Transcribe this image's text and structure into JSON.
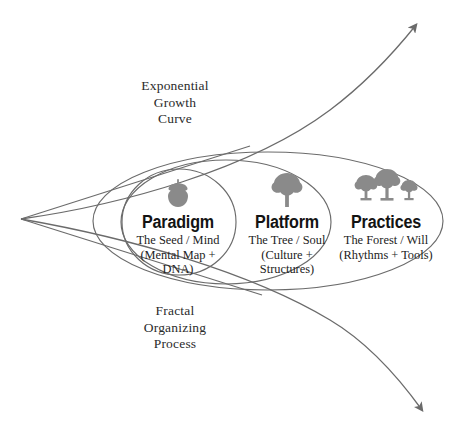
{
  "diagram": {
    "title": "Fractal Organizing Process",
    "stroke_color": "#6b6b6b",
    "icon_color": "#8a8a8a",
    "text_color": "#1a1a1a",
    "background": "#ffffff",
    "curve_labels": {
      "top": "Exponential\nGrowth\nCurve",
      "bottom": "Fractal\nOrganizing\nProcess"
    },
    "zones": [
      {
        "id": "paradigm",
        "heading": "Paradigm",
        "subtitle": "The Seed / Mind\n(Mental Map +\nDNA)",
        "icon": "acorn-icon"
      },
      {
        "id": "platform",
        "heading": "Platform",
        "subtitle": "The Tree / Soul\n(Culture +\nStructures)",
        "icon": "tree-icon"
      },
      {
        "id": "practices",
        "heading": "Practices",
        "subtitle": "The Forest / Will\n(Rhythms + Tools)",
        "icon": "forest-icon"
      }
    ]
  }
}
